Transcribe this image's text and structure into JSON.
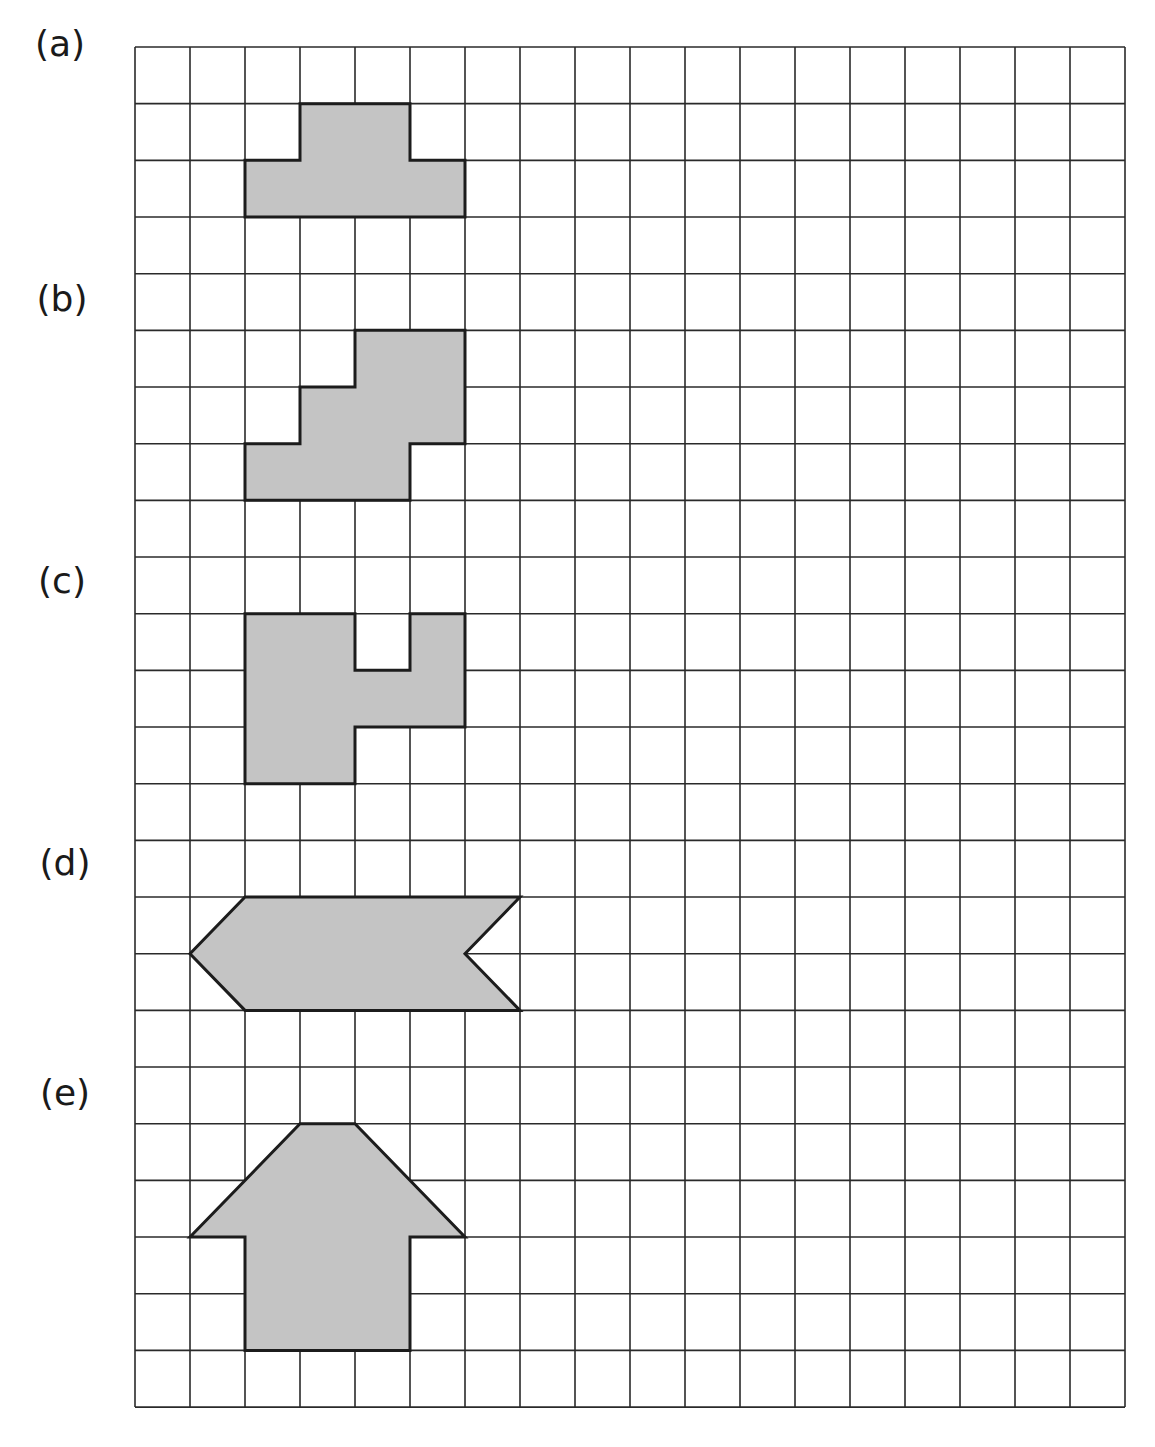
{
  "figure": {
    "grid": {
      "columns": 18,
      "rows": 24,
      "origin_x": 135,
      "origin_y": 47,
      "cell_width": 55,
      "cell_height": 56.67,
      "line_color": "#2a2a2a"
    },
    "shape_fill": "#c4c4c4",
    "shape_stroke": "#1c1c1c",
    "shapes": [
      {
        "id": "a",
        "label": "(a)",
        "label_x": 60,
        "label_y": 43,
        "points": [
          [
            3,
            1
          ],
          [
            5,
            1
          ],
          [
            5,
            2
          ],
          [
            6,
            2
          ],
          [
            6,
            3
          ],
          [
            2,
            3
          ],
          [
            2,
            2
          ],
          [
            3,
            2
          ]
        ]
      },
      {
        "id": "b",
        "label": "(b)",
        "label_x": 62,
        "label_y": 298,
        "points": [
          [
            4,
            5
          ],
          [
            6,
            5
          ],
          [
            6,
            7
          ],
          [
            5,
            7
          ],
          [
            5,
            8
          ],
          [
            2,
            8
          ],
          [
            2,
            7
          ],
          [
            3,
            7
          ],
          [
            3,
            6
          ],
          [
            4,
            6
          ]
        ]
      },
      {
        "id": "c",
        "label": "(c)",
        "label_x": 62,
        "label_y": 580,
        "points": [
          [
            2,
            10
          ],
          [
            4,
            10
          ],
          [
            4,
            11
          ],
          [
            5,
            11
          ],
          [
            5,
            10
          ],
          [
            6,
            10
          ],
          [
            6,
            12
          ],
          [
            4,
            12
          ],
          [
            4,
            13
          ],
          [
            2,
            13
          ]
        ]
      },
      {
        "id": "d",
        "label": "(d)",
        "label_x": 65,
        "label_y": 862,
        "points": [
          [
            2,
            15
          ],
          [
            7,
            15
          ],
          [
            6,
            16
          ],
          [
            7,
            17
          ],
          [
            2,
            17
          ],
          [
            1,
            16
          ]
        ]
      },
      {
        "id": "e",
        "label": "(e)",
        "label_x": 65,
        "label_y": 1092,
        "points": [
          [
            3,
            19
          ],
          [
            4,
            19
          ],
          [
            6,
            21
          ],
          [
            5,
            21
          ],
          [
            5,
            23
          ],
          [
            2,
            23
          ],
          [
            2,
            21
          ],
          [
            1,
            21
          ]
        ]
      }
    ]
  }
}
